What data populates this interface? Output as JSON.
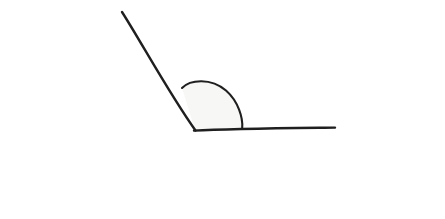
{
  "question": {
    "figure": {
      "name": "hand-drawn-angle-figure",
      "description": "obtuse angle formed by a ray and a horizontal line with a shaded arc at the vertex",
      "vertex": {
        "x": 195,
        "y": 130
      },
      "ray_endpoint": {
        "x": 122,
        "y": 12
      },
      "baseline_endpoint": {
        "x": 335,
        "y": 128
      },
      "arc": {
        "start": {
          "x": 182,
          "y": 88
        },
        "apex": {
          "x": 214,
          "y": 85
        },
        "end": {
          "x": 242,
          "y": 128
        }
      },
      "stroke_color": "#1f1f1f",
      "arc_fill_color": "#f7f7f5",
      "background_color": "#ffffff"
    },
    "options": [
      {
        "id": "obtuse",
        "label": "obtuse"
      },
      {
        "id": "acute",
        "label": "acute"
      },
      {
        "id": "right-angle",
        "label": "right angle"
      },
      {
        "id": "reflex",
        "label": "reflex"
      }
    ]
  }
}
